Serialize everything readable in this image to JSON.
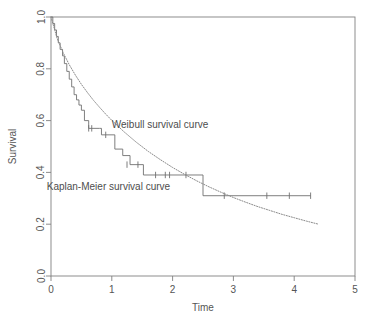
{
  "chart_data": {
    "type": "line",
    "title": "",
    "xlabel": "Time",
    "ylabel": "Survival",
    "xlim": [
      0,
      5
    ],
    "ylim": [
      0,
      1.0
    ],
    "grid": false,
    "legend_position": "inline-annotations",
    "xticks": [
      "0",
      "1",
      "2",
      "3",
      "4",
      "5"
    ],
    "xtick_values": [
      0,
      1,
      2,
      3,
      4,
      5
    ],
    "yticks": [
      "0.0",
      "0.2",
      "0.4",
      "0.6",
      "0.8",
      "1.0"
    ],
    "ytick_values": [
      0.0,
      0.2,
      0.4,
      0.6,
      0.8,
      1.0
    ],
    "annotations": [
      {
        "text": "Weibull survival curve",
        "x": 1.0,
        "y": 0.585
      },
      {
        "text": "Kaplan-Meier survival curve",
        "x": -0.07,
        "y": 0.345
      }
    ],
    "series": [
      {
        "name": "Kaplan-Meier survival curve",
        "type": "step",
        "color": "#707070",
        "x": [
          0.0,
          0.03,
          0.06,
          0.09,
          0.12,
          0.15,
          0.19,
          0.22,
          0.26,
          0.3,
          0.34,
          0.38,
          0.42,
          0.46,
          0.5,
          0.55,
          0.62,
          0.8,
          0.83,
          0.97,
          1.05,
          1.18,
          1.3,
          1.52,
          2.5,
          4.27
        ],
        "y": [
          1.0,
          0.975,
          0.95,
          0.925,
          0.9,
          0.875,
          0.85,
          0.82,
          0.79,
          0.76,
          0.73,
          0.7,
          0.68,
          0.66,
          0.64,
          0.6,
          0.57,
          0.57,
          0.545,
          0.545,
          0.49,
          0.465,
          0.43,
          0.39,
          0.31,
          0.31
        ],
        "censor_marks": [
          {
            "x": 0.62,
            "y": 0.57
          },
          {
            "x": 0.67,
            "y": 0.57
          },
          {
            "x": 0.9,
            "y": 0.545
          },
          {
            "x": 1.25,
            "y": 0.43
          },
          {
            "x": 1.43,
            "y": 0.43
          },
          {
            "x": 1.72,
            "y": 0.39
          },
          {
            "x": 1.88,
            "y": 0.39
          },
          {
            "x": 1.95,
            "y": 0.39
          },
          {
            "x": 2.22,
            "y": 0.39
          },
          {
            "x": 2.85,
            "y": 0.31
          },
          {
            "x": 3.55,
            "y": 0.31
          },
          {
            "x": 3.92,
            "y": 0.31
          },
          {
            "x": 4.27,
            "y": 0.31
          }
        ]
      },
      {
        "name": "Weibull survival curve",
        "type": "dotted-line",
        "color": "#8a8a8a",
        "x": [
          0.0,
          0.1,
          0.2,
          0.3,
          0.4,
          0.5,
          0.6,
          0.7,
          0.8,
          0.9,
          1.0,
          1.2,
          1.4,
          1.6,
          1.8,
          2.0,
          2.2,
          2.4,
          2.6,
          2.8,
          3.0,
          3.2,
          3.4,
          3.6,
          3.8,
          4.0,
          4.2,
          4.4
        ],
        "y": [
          1.0,
          0.918,
          0.862,
          0.816,
          0.776,
          0.74,
          0.708,
          0.678,
          0.651,
          0.625,
          0.601,
          0.557,
          0.517,
          0.481,
          0.449,
          0.419,
          0.392,
          0.367,
          0.344,
          0.323,
          0.303,
          0.285,
          0.268,
          0.253,
          0.238,
          0.225,
          0.212,
          0.2
        ]
      }
    ]
  },
  "axes": {
    "box_color": "#808080",
    "tick_color": "#808080"
  }
}
